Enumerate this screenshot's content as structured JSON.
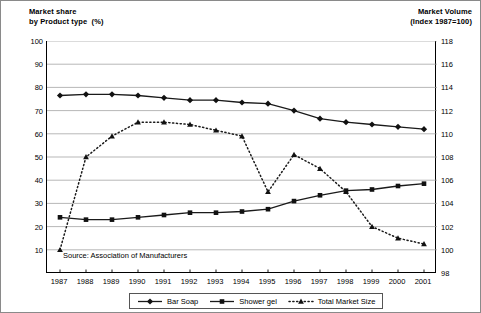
{
  "axes": {
    "left_title": "Market share\nby Product type  (%)",
    "right_title": "Market Volume\n(Index 1987=100)",
    "left_ticks": [
      100,
      90,
      80,
      70,
      60,
      50,
      40,
      30,
      20,
      10
    ],
    "right_ticks": [
      118,
      116,
      114,
      112,
      110,
      108,
      106,
      104,
      102,
      100,
      98
    ],
    "left_range": [
      0,
      100
    ],
    "right_range": [
      98,
      118
    ]
  },
  "source_note": "Source: Association of Manufacturers",
  "legend": {
    "items": [
      {
        "label": "Bar Soap",
        "marker": "diamond",
        "style": "solid"
      },
      {
        "label": "Shower gel",
        "marker": "square",
        "style": "solid"
      },
      {
        "label": "Total Market Size",
        "marker": "triangle",
        "style": "dotted"
      }
    ]
  },
  "chart_data": {
    "type": "line",
    "title": "",
    "xlabel": "",
    "ylabel": "Market share by Product type (%)",
    "y2label": "Market Volume (Index 1987=100)",
    "ylim": [
      0,
      100
    ],
    "y2lim": [
      98,
      118
    ],
    "grid": true,
    "legend_position": "bottom",
    "categories": [
      "1987",
      "1988",
      "1989",
      "1990",
      "1991",
      "1992",
      "1993",
      "1994",
      "1995",
      "1996",
      "1997",
      "1998",
      "1999",
      "2000",
      "2001"
    ],
    "series": [
      {
        "name": "Bar Soap",
        "axis": "left",
        "marker": "diamond",
        "style": "solid",
        "values": [
          76.5,
          77.0,
          77.0,
          76.5,
          75.5,
          74.5,
          74.5,
          73.5,
          73.0,
          70.0,
          66.5,
          65.0,
          64.0,
          63.0,
          62.0
        ]
      },
      {
        "name": "Shower gel",
        "axis": "left",
        "marker": "square",
        "style": "solid",
        "values": [
          24.0,
          23.0,
          23.0,
          24.0,
          25.0,
          26.0,
          26.0,
          26.5,
          27.5,
          31.0,
          33.5,
          35.5,
          36.0,
          37.5,
          38.5
        ]
      },
      {
        "name": "Total Market Size",
        "axis": "right",
        "marker": "triangle",
        "style": "dotted",
        "values_index": [
          100.0,
          108.0,
          109.8,
          111.0,
          111.0,
          110.8,
          110.3,
          109.8,
          105.0,
          108.2,
          107.0,
          105.0,
          102.0,
          101.0,
          100.4
        ],
        "values_left_equiv": [
          10.0,
          50.0,
          59.0,
          65.0,
          65.0,
          64.0,
          61.5,
          59.0,
          35.0,
          51.0,
          45.0,
          35.0,
          20.0,
          15.0,
          12.5
        ]
      }
    ]
  }
}
